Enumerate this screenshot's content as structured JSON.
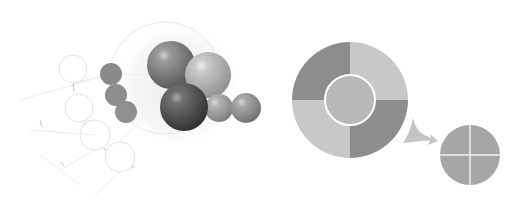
{
  "illustration": {
    "background": "#ffffff",
    "left_group": {
      "description": "molecular / network cluster of spheres with faint outlined circles",
      "outline_circles": [
        {
          "cx": 73,
          "cy": 69,
          "r": 14
        },
        {
          "cx": 79,
          "cy": 108,
          "r": 14
        },
        {
          "cx": 95,
          "cy": 135,
          "r": 15
        },
        {
          "cx": 120,
          "cy": 157,
          "r": 15
        }
      ],
      "flat_spheres": [
        {
          "cx": 111,
          "cy": 74,
          "r": 11,
          "color": "#8a8a8a"
        },
        {
          "cx": 116,
          "cy": 95,
          "r": 11,
          "color": "#8d8d8d"
        },
        {
          "cx": 126,
          "cy": 112,
          "r": 11,
          "color": "#8f8f8f"
        }
      ],
      "shaded_spheres": [
        {
          "cx": 171,
          "cy": 65,
          "r": 24,
          "light": "#9a9a9a",
          "dark": "#555555"
        },
        {
          "cx": 208,
          "cy": 75,
          "r": 23,
          "light": "#c9c9c9",
          "dark": "#8f8f8f"
        },
        {
          "cx": 219,
          "cy": 108,
          "r": 14,
          "light": "#b5b5b5",
          "dark": "#7c7c7c"
        },
        {
          "cx": 246,
          "cy": 108,
          "r": 15,
          "light": "#aaaaaa",
          "dark": "#707070"
        },
        {
          "cx": 184,
          "cy": 107,
          "r": 24,
          "light": "#707070",
          "dark": "#2e2e2e"
        }
      ],
      "halo": {
        "cx": 170,
        "cy": 75,
        "r": 58,
        "color": "#e6e6e6"
      }
    },
    "right_group": {
      "donut": {
        "cx": 350,
        "cy": 100,
        "r_outer": 58,
        "r_inner": 25,
        "quadrants": [
          {
            "position": "top-left",
            "color": "#8d8d8d"
          },
          {
            "position": "top-right",
            "color": "#c8c8c8"
          },
          {
            "position": "bottom-right",
            "color": "#8d8d8d"
          },
          {
            "position": "bottom-left",
            "color": "#c8c8c8"
          }
        ],
        "center_color": "#b8b8b8",
        "center_stroke": "#ffffff"
      },
      "arrow": {
        "color": "#c4c4c4",
        "from": [
          405,
          125
        ],
        "to": [
          436,
          140
        ]
      },
      "pie": {
        "cx": 470,
        "cy": 155,
        "r": 30,
        "color": "#a6a6a6",
        "divider_color": "#f2f2f2"
      }
    }
  }
}
